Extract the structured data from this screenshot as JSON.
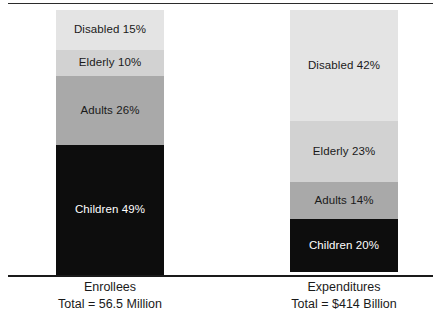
{
  "figure": {
    "has_top_rule": true,
    "has_baseline": true,
    "background_color": "#ffffff"
  },
  "chart_data": {
    "type": "bar",
    "subtype": "stacked-100-percent",
    "title": "",
    "subtitle": "",
    "xlabel": "",
    "ylabel": "",
    "ylim": [
      0,
      100
    ],
    "grid": false,
    "legend": "none",
    "value_labels_inside_segments": true,
    "categories": [
      "Enrollees",
      "Expenditures"
    ],
    "category_totals": [
      "Total = 56.5 Million",
      "Total = $414 Billion"
    ],
    "series": [
      {
        "name": "Disabled",
        "values": [
          15,
          42
        ],
        "color": "#e4e4e4",
        "text_color": "#1a1a1a"
      },
      {
        "name": "Elderly",
        "values": [
          10,
          23
        ],
        "color": "#d2d2d2",
        "text_color": "#1a1a1a"
      },
      {
        "name": "Adults",
        "values": [
          26,
          14
        ],
        "color": "#a9a9a9",
        "text_color": "#1a1a1a"
      },
      {
        "name": "Children",
        "values": [
          49,
          20
        ],
        "color": "#0d0d0d",
        "text_color": "#ffffff"
      }
    ],
    "stack_order_top_to_bottom": [
      "Disabled",
      "Elderly",
      "Adults",
      "Children"
    ]
  },
  "bars": {
    "enrollees": {
      "caption_title": "Enrollees",
      "caption_total": "Total = 56.5 Million",
      "segments": [
        {
          "label": "Disabled 15%",
          "name": "Disabled",
          "percent": 15
        },
        {
          "label": "Elderly 10%",
          "name": "Elderly",
          "percent": 10
        },
        {
          "label": "Adults 26%",
          "name": "Adults",
          "percent": 26
        },
        {
          "label": "Children 49%",
          "name": "Children",
          "percent": 49
        }
      ]
    },
    "expenditures": {
      "caption_title": "Expenditures",
      "caption_total": "Total = $414 Billion",
      "segments": [
        {
          "label": "Disabled 42%",
          "name": "Disabled",
          "percent": 42
        },
        {
          "label": "Elderly 23%",
          "name": "Elderly",
          "percent": 23
        },
        {
          "label": "Adults 14%",
          "name": "Adults",
          "percent": 14
        },
        {
          "label": "Children 20%",
          "name": "Children",
          "percent": 20
        }
      ]
    }
  }
}
